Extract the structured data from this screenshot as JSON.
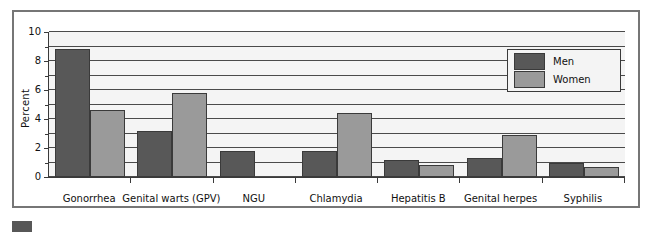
{
  "chart_data": {
    "type": "bar",
    "title": "",
    "subtitle": "",
    "xlabel": "",
    "ylabel": "Percent",
    "ylim": [
      0,
      10
    ],
    "y_ticks": [
      0,
      2,
      4,
      6,
      8,
      10
    ],
    "y_tick_labels": [
      "0",
      "2",
      "4",
      "6",
      "8",
      "10"
    ],
    "y_minor_step": 1,
    "grid": "horizontal",
    "legend_position": "upper right",
    "categories": [
      "Gonorrhea",
      "Genital warts (GPV)",
      "NGU",
      "Chlamydia",
      "Hepatitis B",
      "Genital herpes",
      "Syphilis"
    ],
    "series": [
      {
        "name": "Men",
        "color": "#585858",
        "values": [
          8.85,
          3.2,
          1.8,
          1.8,
          1.2,
          1.3,
          0.95
        ]
      },
      {
        "name": "Women",
        "color": "#9a9a9a",
        "values": [
          4.65,
          5.8,
          0,
          4.4,
          0.8,
          2.9,
          0.7
        ]
      }
    ]
  },
  "legend": {
    "entries": [
      {
        "label": "Men",
        "swatch": "men-swatch"
      },
      {
        "label": "Women",
        "swatch": "women-swatch"
      }
    ]
  },
  "colors": {
    "men": "#585858",
    "women": "#9a9a9a",
    "axis": "#3a3a3a",
    "frame": "#767676",
    "plot_background": "#f4f4f4"
  }
}
